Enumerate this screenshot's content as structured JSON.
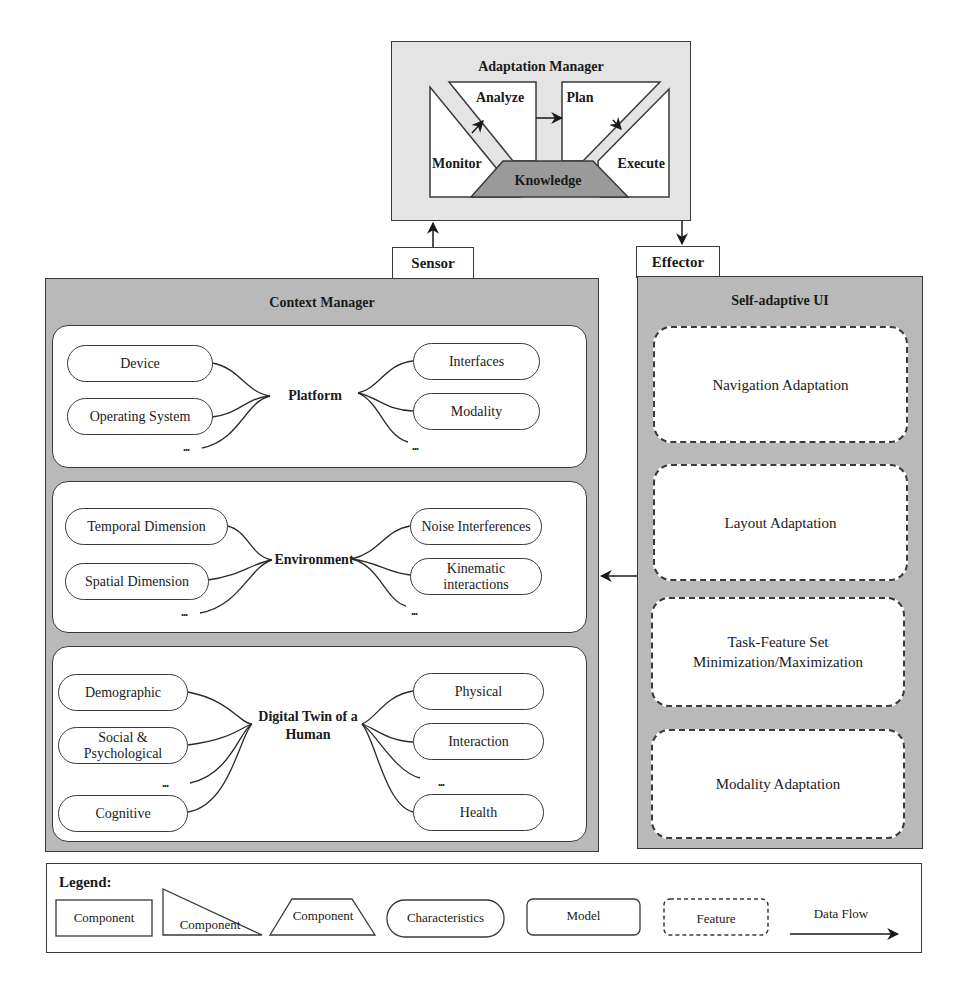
{
  "adaptation_manager": {
    "title": "Adaptation Manager",
    "phases": {
      "monitor": "Monitor",
      "analyze": "Analyze",
      "plan": "Plan",
      "execute": "Execute",
      "knowledge": "Knowledge"
    }
  },
  "sensor": {
    "label": "Sensor"
  },
  "effector": {
    "label": "Effector"
  },
  "context_manager": {
    "title": "Context Manager",
    "models": [
      {
        "hub": "Platform",
        "left": [
          "Device",
          "Operating System"
        ],
        "left_more": "...",
        "right": [
          "Interfaces",
          "Modality"
        ],
        "right_more": "..."
      },
      {
        "hub": "Environment",
        "left": [
          "Temporal Dimension",
          "Spatial Dimension"
        ],
        "left_more": "...",
        "right": [
          "Noise Interferences",
          "Kinematic interactions"
        ],
        "right_more": "..."
      },
      {
        "hub": "Digital Twin of a Human",
        "left": [
          "Demographic",
          "Social & Psychological",
          "Cognitive"
        ],
        "left_more": "...",
        "right": [
          "Physical",
          "Interaction",
          "Health"
        ],
        "right_more": "..."
      }
    ]
  },
  "self_adaptive_ui": {
    "title": "Self-adaptive UI",
    "features": [
      "Navigation Adaptation",
      "Layout Adaptation",
      "Task-Feature Set Minimization/Maximization",
      "Modality Adaptation"
    ]
  },
  "legend": {
    "title": "Legend:",
    "items": {
      "component_rect": "Component",
      "component_triangle": "Component",
      "component_trapezoid": "Component",
      "characteristics": "Characteristics",
      "model": "Model",
      "feature": "Feature",
      "data_flow": "Data Flow"
    }
  },
  "colors": {
    "panel_dark": "#b9b9b9",
    "panel_light": "#e4e4e4",
    "knowledge_fill": "#9a9a9a",
    "stroke": "#3a3a3a"
  }
}
